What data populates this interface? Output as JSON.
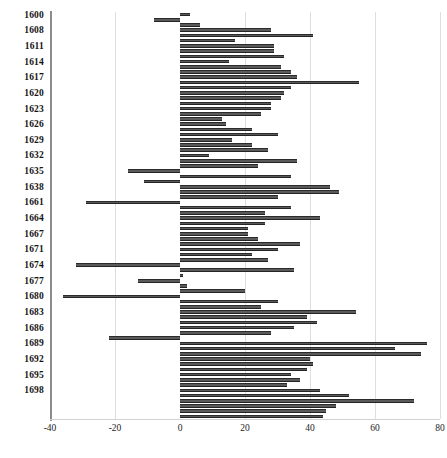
{
  "chart_data": {
    "type": "bar",
    "orientation": "horizontal",
    "title": "",
    "subtitle": "",
    "xlabel": "",
    "ylabel": "",
    "xlim": [
      -40,
      80
    ],
    "ylim": null,
    "grid": true,
    "legend": null,
    "bar_color": "#5a5a5a",
    "bar_edge_color": "#2b2b2b",
    "gridline_color": "#dededa",
    "axis_color": "#8c8c8c",
    "x_ticks": [
      -40,
      -20,
      0,
      20,
      40,
      60,
      80
    ],
    "x_tick_labels": [
      "-40",
      "-20",
      "0",
      "20",
      "40",
      "60",
      "80"
    ],
    "y_tick_labels": [
      "1600",
      "1608",
      "1611",
      "1614",
      "1617",
      "1620",
      "1623",
      "1626",
      "1629",
      "1632",
      "1635",
      "1638",
      "1661",
      "1664",
      "1667",
      "1671",
      "1674",
      "1677",
      "1680",
      "1683",
      "1686",
      "1689",
      "1692",
      "1695",
      "1698"
    ],
    "y_tick_every_n_bars": 3,
    "categories": [
      "1600",
      "1601",
      "1602",
      "1608",
      "1609",
      "1610",
      "1611",
      "1612",
      "1613",
      "1614",
      "1615",
      "1616",
      "1617",
      "1618",
      "1619",
      "1620",
      "1621",
      "1622",
      "1623",
      "1624",
      "1625",
      "1626",
      "1627",
      "1628",
      "1629",
      "1630",
      "1631",
      "1632",
      "1633",
      "1634",
      "1635",
      "1636",
      "1637",
      "1638",
      "1639",
      "1640",
      "1661",
      "1662",
      "1663",
      "1664",
      "1665",
      "1666",
      "1667",
      "1668",
      "1669",
      "1671",
      "1672",
      "1673",
      "1674",
      "1675",
      "1676",
      "1677",
      "1678",
      "1679",
      "1680",
      "1681",
      "1682",
      "1683",
      "1684",
      "1685",
      "1686",
      "1687",
      "1688",
      "1689",
      "1690",
      "1691",
      "1692",
      "1693",
      "1694",
      "1695",
      "1696",
      "1697",
      "1698",
      "1699",
      "1700",
      "1701",
      "1702",
      "1703"
    ],
    "values": [
      3,
      -8,
      6,
      28,
      41,
      17,
      29,
      29,
      32,
      15,
      31,
      34,
      36,
      55,
      34,
      32,
      31,
      28,
      28,
      25,
      13,
      14,
      22,
      30,
      16,
      22,
      27,
      9,
      36,
      24,
      -16,
      34,
      -11,
      46,
      49,
      30,
      -29,
      34,
      26,
      43,
      26,
      21,
      21,
      24,
      37,
      30,
      22,
      27,
      -32,
      35,
      1,
      -13,
      2,
      20,
      -36,
      30,
      25,
      54,
      39,
      42,
      35,
      28,
      -22,
      76,
      66,
      74,
      40,
      41,
      39,
      34,
      37,
      33,
      43,
      52,
      72,
      48,
      45,
      44
    ],
    "num_bars": 78
  }
}
